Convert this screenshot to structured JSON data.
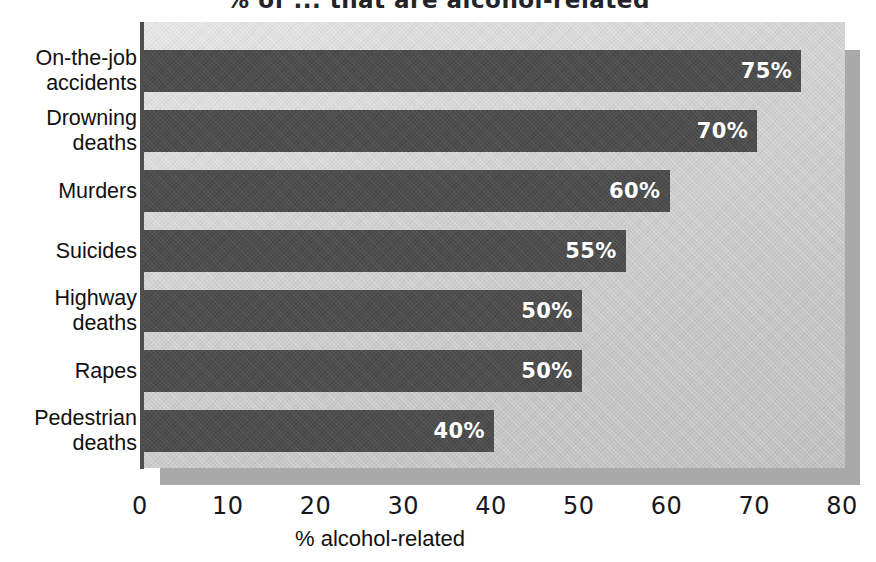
{
  "chart_data": {
    "type": "bar",
    "orientation": "horizontal",
    "title": "% of ... that are alcohol-related",
    "categories": [
      "On-the-job\naccidents",
      "Drowning\ndeaths",
      "Murders",
      "Suicides",
      "Highway\ndeaths",
      "Rapes",
      "Pedestrian\ndeaths"
    ],
    "values": [
      75,
      70,
      60,
      55,
      50,
      50,
      40
    ],
    "value_labels": [
      "75%",
      "70%",
      "60%",
      "55%",
      "50%",
      "50%",
      "40%"
    ],
    "xlabel": "% alcohol-related",
    "ylabel": "",
    "xlim": [
      0,
      80
    ],
    "xticks": [
      0,
      10,
      20,
      30,
      40,
      50,
      60,
      70,
      80
    ],
    "xtick_labels": [
      "0",
      "10",
      "20",
      "30",
      "40",
      "50",
      "60",
      "70",
      "80"
    ],
    "grid": false,
    "legend": null,
    "colors": {
      "bar": "#4d4d4d",
      "panel_background": "#cfcfcf",
      "panel_shadow": "#a9a9a9",
      "axis_line": "#4e4e4e",
      "value_text": "#ffffff",
      "label_text": "#111111",
      "page_background": "#ffffff"
    }
  }
}
